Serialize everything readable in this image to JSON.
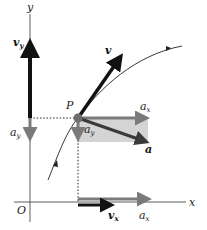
{
  "diagram": {
    "axes": {
      "x_label": "x",
      "y_label": "y",
      "origin_label": "O"
    },
    "point": {
      "label": "P"
    },
    "vectors": {
      "v": {
        "label": "v"
      },
      "a": {
        "label": "a"
      },
      "v_y": {
        "label": "v",
        "sub": "y"
      },
      "v_x": {
        "label": "v",
        "sub": "x"
      },
      "a_x_at_P": {
        "label": "a",
        "sub": "x"
      },
      "a_y_at_P": {
        "label": "a",
        "sub": "y"
      },
      "a_y_on_axis": {
        "label": "a",
        "sub": "y"
      },
      "a_x_on_axis": {
        "label": "a",
        "sub": "x"
      }
    },
    "colors": {
      "velocity": "#111111",
      "acceleration": "#7a7a7a",
      "rect_fill": "#d4d4d4",
      "point": "#6e6e6e",
      "axis": "#333333"
    }
  }
}
